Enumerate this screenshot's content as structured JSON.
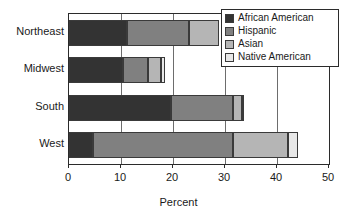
{
  "chart_data": {
    "type": "bar",
    "orientation": "horizontal",
    "stacked": true,
    "title": "",
    "xlabel": "Percent",
    "ylabel": "",
    "xlim": [
      0,
      50
    ],
    "xticks": [
      0,
      10,
      20,
      30,
      40,
      50
    ],
    "xtick_labels": [
      "0",
      "10",
      "20",
      "30",
      "40",
      "50"
    ],
    "grid": true,
    "legend_position": "top-right",
    "categories": [
      "Northeast",
      "Midwest",
      "South",
      "West"
    ],
    "series": [
      {
        "name": "African American",
        "color": "#333333",
        "values": [
          11.2,
          10.4,
          19.6,
          4.7
        ]
      },
      {
        "name": "Hispanic",
        "color": "#808080",
        "values": [
          11.8,
          4.8,
          11.9,
          26.9
        ]
      },
      {
        "name": "Asian",
        "color": "#b5b5b5",
        "values": [
          5.8,
          2.5,
          1.7,
          10.6
        ]
      },
      {
        "name": "Native American",
        "color": "#e8e8e8",
        "values": [
          0.0,
          0.8,
          0.5,
          1.8
        ]
      }
    ],
    "totals": [
      28.8,
      18.5,
      33.7,
      44.0
    ]
  },
  "legend": {
    "items": [
      {
        "label": "African American",
        "swatch": "legend-swatch-african-american"
      },
      {
        "label": "Hispanic",
        "swatch": "legend-swatch-hispanic"
      },
      {
        "label": "Asian",
        "swatch": "legend-swatch-asian"
      },
      {
        "label": "Native American",
        "swatch": "legend-swatch-native-american"
      }
    ]
  },
  "axis": {
    "x_title": "Percent"
  }
}
